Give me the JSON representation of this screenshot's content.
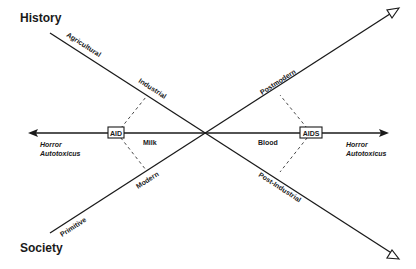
{
  "headings": {
    "top_left": "History",
    "bottom_left": "Society"
  },
  "axis": {
    "left_label_line1": "Horror",
    "left_label_line2": "Autotoxicus",
    "right_label_line1": "Horror",
    "right_label_line2": "Autotoxicus",
    "left_box": "AID",
    "right_box": "AIDS",
    "left_segment": "Milk",
    "right_segment": "Blood"
  },
  "history_line": {
    "stage1": "Agricultural",
    "stage2": "Industrial",
    "stage3": "Post-Industrial"
  },
  "society_line": {
    "stage1": "Primitive",
    "stage2": "Modern",
    "stage3": "Postmodern"
  },
  "colors": {
    "ink": "#1a1a1a",
    "background": "#ffffff"
  }
}
